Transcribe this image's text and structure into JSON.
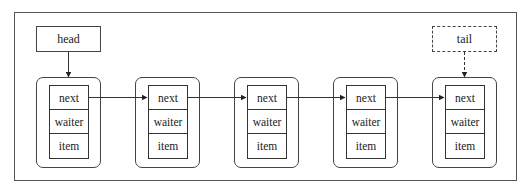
{
  "diagram": {
    "type": "linked-list",
    "pointers": {
      "head": {
        "label": "head",
        "style": "solid",
        "target_node": 0
      },
      "tail": {
        "label": "tail",
        "style": "dashed",
        "target_node": 4
      }
    },
    "nodes": [
      {
        "fields": [
          "next",
          "waiter",
          "item"
        ]
      },
      {
        "fields": [
          "next",
          "waiter",
          "item"
        ]
      },
      {
        "fields": [
          "next",
          "waiter",
          "item"
        ]
      },
      {
        "fields": [
          "next",
          "waiter",
          "item"
        ]
      },
      {
        "fields": [
          "next",
          "waiter",
          "item"
        ]
      }
    ],
    "edges": [
      {
        "from": 0,
        "to": 1,
        "field": "next"
      },
      {
        "from": 1,
        "to": 2,
        "field": "next"
      },
      {
        "from": 2,
        "to": 3,
        "field": "next"
      },
      {
        "from": 3,
        "to": 4,
        "field": "next"
      }
    ],
    "colors": {
      "stroke": "#444444",
      "background": "#ffffff"
    }
  }
}
